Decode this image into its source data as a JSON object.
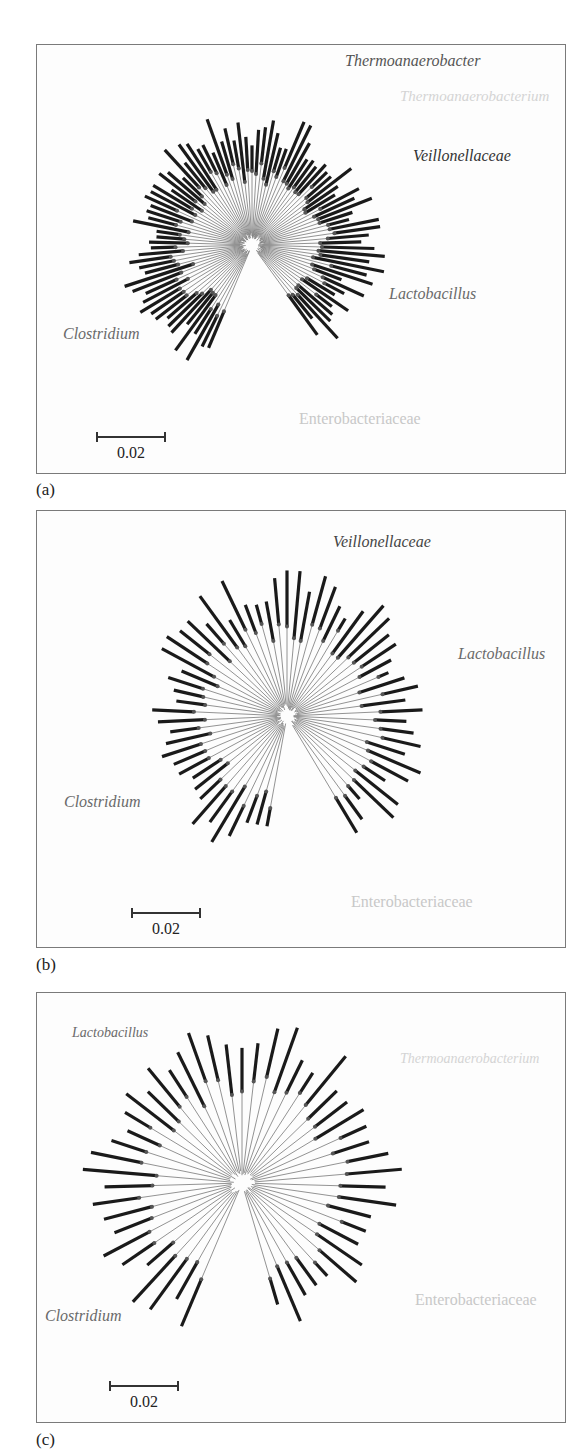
{
  "figure": {
    "panels": [
      {
        "id": "a",
        "label": "(a)",
        "scale_bar": "0.02",
        "clades": [
          {
            "name": "Thermoanaerobacter",
            "color": "#555555",
            "italic": true
          },
          {
            "name": "Thermoanaerobacterium",
            "color": "#d4d4d4",
            "italic": true
          },
          {
            "name": "Veillonellaceae",
            "color": "#333333",
            "italic": true
          },
          {
            "name": "Lactobacillus",
            "color": "#6a6a6a",
            "italic": true
          },
          {
            "name": "Clostridium",
            "color": "#6a6a6a",
            "italic": true
          },
          {
            "name": "Enterobacteriaceae",
            "color": "#c8c8c8",
            "italic": false
          }
        ]
      },
      {
        "id": "b",
        "label": "(b)",
        "scale_bar": "0.02",
        "clades": [
          {
            "name": "Veillonellaceae",
            "color": "#444444",
            "italic": true
          },
          {
            "name": "Lactobacillus",
            "color": "#6a6a6a",
            "italic": true
          },
          {
            "name": "Clostridium",
            "color": "#6a6a6a",
            "italic": true
          },
          {
            "name": "Enterobacteriaceae",
            "color": "#c8c8c8",
            "italic": false
          }
        ]
      },
      {
        "id": "c",
        "label": "(c)",
        "scale_bar": "0.02",
        "clades": [
          {
            "name": "Lactobacillus",
            "color": "#6a6a6a",
            "italic": true
          },
          {
            "name": "Thermoanaerobacterium",
            "color": "#d4d4d4",
            "italic": true
          },
          {
            "name": "Clostridium",
            "color": "#6a6a6a",
            "italic": true
          },
          {
            "name": "Enterobacteriaceae",
            "color": "#c8c8c8",
            "italic": false
          }
        ]
      }
    ]
  }
}
